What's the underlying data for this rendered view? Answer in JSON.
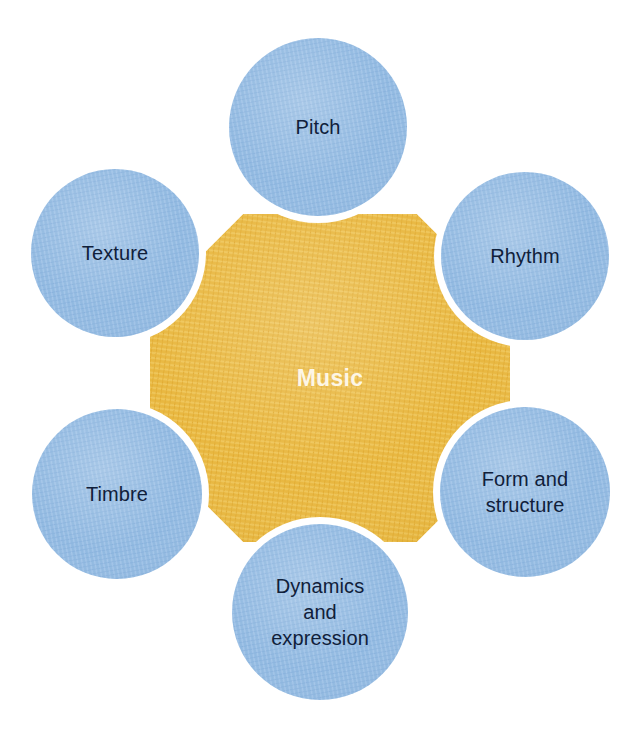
{
  "diagram": {
    "type": "hub-and-spoke",
    "background_color": "#ffffff",
    "center": {
      "label": "Music",
      "shape": "hexagon",
      "fill_color": "#e8b63c",
      "text_color": "#fdf6e6",
      "cx": 330,
      "cy": 378
    },
    "node_fill_color": "#8fb8e0",
    "node_text_color": "#10203a",
    "nodes": [
      {
        "id": "pitch",
        "label": "Pitch",
        "cx": 318,
        "cy": 127,
        "r": 89,
        "position": "top"
      },
      {
        "id": "rhythm",
        "label": "Rhythm",
        "cx": 525,
        "cy": 256,
        "r": 84,
        "position": "top-right"
      },
      {
        "id": "form-and-structure",
        "label": "Form and\nstructure",
        "cx": 525,
        "cy": 492,
        "r": 85,
        "position": "bottom-right"
      },
      {
        "id": "dynamics-and-expression",
        "label": "Dynamics\nand\nexpression",
        "cx": 320,
        "cy": 612,
        "r": 88,
        "position": "bottom"
      },
      {
        "id": "timbre",
        "label": "Timbre",
        "cx": 117,
        "cy": 494,
        "r": 85,
        "position": "bottom-left"
      },
      {
        "id": "texture",
        "label": "Texture",
        "cx": 115,
        "cy": 253,
        "r": 84,
        "position": "top-left"
      }
    ]
  }
}
